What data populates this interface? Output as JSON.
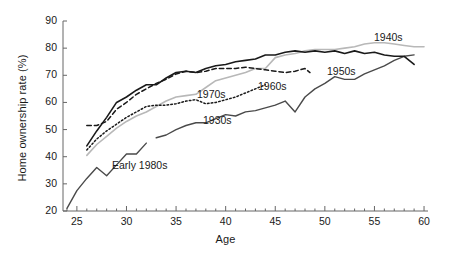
{
  "figure": {
    "background": "#ffffff",
    "plot_background": "#ffffff",
    "axis_color": "#666666"
  },
  "axes": {
    "xlabel": "Age",
    "ylabel": "Home ownership rate (%)",
    "xticks": [
      "25",
      "30",
      "35",
      "40",
      "45",
      "50",
      "55",
      "60"
    ],
    "yticks": [
      "20",
      "30",
      "40",
      "50",
      "60",
      "70",
      "80",
      "90"
    ],
    "xlim": [
      23.6,
      60.4
    ],
    "ylim": [
      20,
      90
    ],
    "x_minor_tick_step": 1,
    "grid": false
  },
  "series_labels": [
    {
      "key": "s1940s",
      "text": "1940s",
      "x": 374,
      "y": 31
    },
    {
      "key": "s1950s",
      "text": "1950s",
      "x": 327,
      "y": 65
    },
    {
      "key": "s1960s",
      "text": "1960s",
      "x": 258,
      "y": 80
    },
    {
      "key": "s1970s",
      "text": "1970s",
      "x": 197,
      "y": 88
    },
    {
      "key": "s1930s",
      "text": "1930s",
      "x": 203,
      "y": 114
    },
    {
      "key": "s1980s",
      "text": "Early 1980s",
      "x": 112,
      "y": 159
    }
  ],
  "chart_data": {
    "type": "line",
    "title": "",
    "xlabel": "Age",
    "ylabel": "Home ownership rate (%)",
    "xlim": [
      23.6,
      60.4
    ],
    "ylim": [
      20,
      90
    ],
    "grid": false,
    "legend": "inline-labels",
    "series": [
      {
        "name": "1930s",
        "style": "solid",
        "color": "#4a4a4a",
        "width": 1.4,
        "x": [
          33,
          34,
          35,
          36,
          37,
          38,
          39,
          40,
          41,
          42,
          43,
          44,
          45,
          46,
          47,
          48,
          49,
          50,
          51,
          52,
          53,
          54,
          55,
          56,
          57,
          58,
          59
        ],
        "y": [
          47.0,
          48.0,
          50.0,
          51.5,
          52.5,
          52.5,
          54.0,
          55.5,
          55.0,
          56.5,
          57.0,
          58.0,
          59.0,
          60.5,
          56.5,
          62.0,
          65.0,
          67.0,
          69.5,
          68.5,
          68.5,
          70.5,
          72.0,
          73.5,
          75.5,
          77.0,
          77.5
        ]
      },
      {
        "name": "1940s",
        "style": "solid",
        "color": "#b8b8b8",
        "width": 1.6,
        "x": [
          26,
          27,
          28,
          29,
          30,
          31,
          32,
          33,
          34,
          35,
          36,
          37,
          38,
          39,
          40,
          41,
          42,
          43,
          44,
          45,
          46,
          47,
          48,
          49,
          50,
          51,
          52,
          53,
          54,
          55,
          56,
          57,
          58,
          59,
          60
        ],
        "y": [
          40.5,
          44.5,
          47.5,
          50.5,
          53.0,
          55.0,
          56.5,
          58.5,
          60.5,
          62.0,
          62.5,
          63.0,
          65.5,
          68.0,
          69.0,
          70.0,
          71.0,
          72.5,
          72.5,
          76.5,
          77.5,
          78.0,
          79.0,
          79.5,
          79.5,
          79.5,
          80.0,
          80.5,
          81.5,
          82.0,
          82.0,
          81.5,
          81.0,
          80.5,
          80.5
        ]
      },
      {
        "name": "1950s",
        "style": "solid",
        "color": "#1a1a1a",
        "width": 1.6,
        "x": [
          26,
          27,
          28,
          29,
          30,
          31,
          32,
          33,
          34,
          35,
          36,
          37,
          38,
          39,
          40,
          41,
          42,
          43,
          44,
          45,
          46,
          47,
          48,
          49,
          50,
          51,
          52,
          53,
          54,
          55,
          56,
          57,
          58,
          59
        ],
        "y": [
          44.0,
          49.5,
          54.5,
          60.0,
          62.0,
          64.5,
          66.5,
          66.5,
          69.0,
          71.0,
          71.5,
          71.0,
          72.5,
          73.5,
          74.0,
          75.0,
          75.5,
          76.0,
          77.5,
          77.5,
          78.5,
          79.0,
          78.5,
          79.0,
          78.5,
          79.0,
          78.0,
          79.0,
          78.0,
          78.5,
          77.5,
          77.0,
          77.0,
          74.0
        ]
      },
      {
        "name": "1960s",
        "style": "dashed",
        "color": "#1a1a1a",
        "width": 1.5,
        "x": [
          26,
          27,
          28,
          29,
          30,
          31,
          32,
          33,
          34,
          35,
          36,
          37,
          38,
          39,
          40,
          41,
          42,
          43,
          44,
          45,
          46,
          47,
          48,
          48.5
        ],
        "y": [
          51.5,
          51.5,
          53.0,
          57.5,
          60.0,
          63.0,
          65.0,
          67.0,
          68.5,
          70.5,
          71.5,
          71.0,
          71.5,
          72.5,
          72.5,
          72.5,
          73.0,
          72.5,
          72.0,
          71.5,
          71.0,
          71.5,
          72.5,
          71.0
        ]
      },
      {
        "name": "1970s",
        "style": "dotted",
        "color": "#1a1a1a",
        "width": 1.5,
        "x": [
          26,
          27,
          28,
          29,
          30,
          31,
          32,
          33,
          34,
          35,
          36,
          37,
          38,
          39,
          40,
          41,
          42,
          43,
          44
        ],
        "y": [
          42.5,
          46.5,
          49.5,
          52.0,
          54.5,
          56.5,
          58.5,
          59.0,
          59.0,
          59.5,
          60.5,
          61.0,
          59.5,
          60.0,
          61.0,
          62.0,
          63.5,
          65.0,
          66.5
        ]
      },
      {
        "name": "Early 1980s",
        "style": "solid",
        "color": "#4a4a4a",
        "width": 1.4,
        "x": [
          24,
          25,
          26,
          27,
          28,
          29,
          30,
          31,
          32
        ],
        "y": [
          21.0,
          27.5,
          32.0,
          36.0,
          33.0,
          37.0,
          41.0,
          41.0,
          45.0
        ]
      }
    ]
  }
}
